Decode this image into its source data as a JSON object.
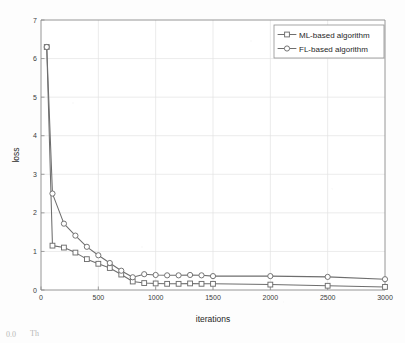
{
  "chart_data": {
    "type": "line",
    "title": "",
    "xlabel": "iterations",
    "ylabel": "loss",
    "xlim": [
      0,
      3000
    ],
    "ylim": [
      0,
      7
    ],
    "xticks": [
      0,
      500,
      1000,
      1500,
      2000,
      2500,
      3000
    ],
    "yticks": [
      0,
      1,
      2,
      3,
      4,
      5,
      6,
      7
    ],
    "xtick_labels": [
      "0",
      "500",
      "1000",
      "1500",
      "2000",
      "2500",
      "3000"
    ],
    "ytick_labels": [
      "0",
      "1",
      "2",
      "3",
      "4",
      "5",
      "6",
      "7"
    ],
    "grid": true,
    "legend_position": "top-right",
    "series": [
      {
        "name": "ML-based algorithm",
        "marker": "square",
        "color": "#6e6e6e",
        "x": [
          50,
          100,
          200,
          300,
          400,
          500,
          600,
          700,
          800,
          900,
          1000,
          1100,
          1200,
          1300,
          1400,
          1500,
          2000,
          2500,
          3000
        ],
        "values": [
          6.3,
          1.15,
          1.1,
          0.97,
          0.8,
          0.68,
          0.57,
          0.4,
          0.22,
          0.18,
          0.17,
          0.16,
          0.16,
          0.17,
          0.16,
          0.16,
          0.14,
          0.11,
          0.08
        ]
      },
      {
        "name": "FL-based algorithm",
        "marker": "circle",
        "color": "#6e6e6e",
        "x": [
          50,
          100,
          200,
          300,
          400,
          500,
          600,
          700,
          800,
          900,
          1000,
          1100,
          1200,
          1300,
          1400,
          1500,
          2000,
          2500,
          3000
        ],
        "values": [
          6.3,
          2.5,
          1.72,
          1.41,
          1.12,
          0.9,
          0.7,
          0.5,
          0.33,
          0.41,
          0.39,
          0.38,
          0.38,
          0.39,
          0.38,
          0.36,
          0.36,
          0.34,
          0.28
        ]
      }
    ]
  },
  "legend": {
    "entries": [
      {
        "label": "ML-based algorithm",
        "marker": "square-marker"
      },
      {
        "label": "FL-based algorithm",
        "marker": "circle-marker"
      }
    ]
  },
  "axes": {
    "x_title": "iterations",
    "y_title": "loss"
  },
  "caption": {
    "fragment_left": "0.0",
    "fragment_right": "Th"
  }
}
